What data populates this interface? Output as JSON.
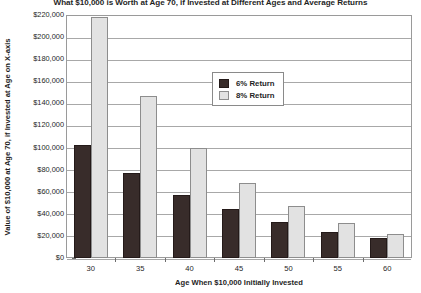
{
  "chart_data": {
    "type": "bar",
    "title": "What $10,000 is Worth at Age 70, if Invested at Different Ages and Average Returns",
    "xlabel": "Age When $10,000 Initially Invested",
    "ylabel": "Value of $10,000 at Age 70, if Invested at Age on X-axis",
    "categories": [
      "30",
      "35",
      "40",
      "45",
      "50",
      "55",
      "60"
    ],
    "series": [
      {
        "name": "6% Return",
        "color": "#382c2a",
        "values": [
          102000,
          77000,
          57000,
          44000,
          33000,
          24000,
          18000
        ]
      },
      {
        "name": "8% Return",
        "color": "#e2e2e2",
        "values": [
          218000,
          147000,
          100000,
          68000,
          47000,
          32000,
          22000
        ]
      }
    ],
    "ylim": [
      0,
      220000
    ],
    "ytick_step": 20000,
    "ytick_labels": [
      "$220,000",
      "$200,000",
      "$180,000",
      "$160,000",
      "$140,000",
      "$120,000",
      "$100,000",
      "$80,000",
      "$60,000",
      "$40,000",
      "$20,000",
      "$0"
    ],
    "grid": true,
    "legend_position": "top-center-right"
  }
}
